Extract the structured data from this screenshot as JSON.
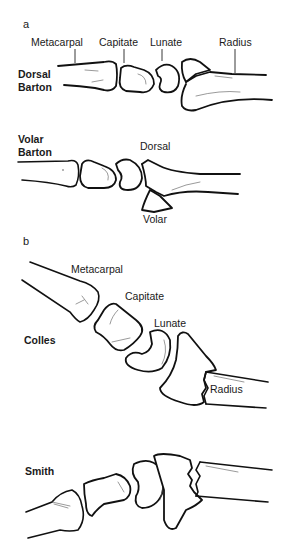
{
  "figure": {
    "panel_a": {
      "letter": "a",
      "dorsal_barton": {
        "title_line1": "Dorsal",
        "title_line2": "Barton",
        "labels": {
          "metacarpal": "Metacarpal",
          "capitate": "Capitate",
          "lunate": "Lunate",
          "radius": "Radius"
        }
      },
      "volar_barton": {
        "title_line1": "Volar",
        "title_line2": "Barton",
        "labels": {
          "dorsal": "Dorsal",
          "volar": "Volar"
        }
      }
    },
    "panel_b": {
      "letter": "b",
      "colles": {
        "title": "Colles",
        "labels": {
          "metacarpal": "Metacarpal",
          "capitate": "Capitate",
          "lunate": "Lunate",
          "radius": "Radius"
        }
      },
      "smith": {
        "title": "Smith"
      }
    },
    "colors": {
      "line": "#111111",
      "background": "#ffffff"
    }
  }
}
